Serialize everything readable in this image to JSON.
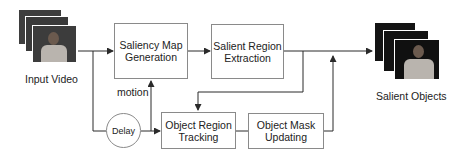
{
  "diagram": {
    "input": {
      "label": "Input Video"
    },
    "output": {
      "label": "Salient Objects"
    },
    "boxes": [
      {
        "id": "saliency",
        "label_line1": "Saliency Map",
        "label_line2": "Generation"
      },
      {
        "id": "extraction",
        "label_line1": "Salient Region",
        "label_line2": "Extraction"
      },
      {
        "id": "tracking",
        "label_line1": "Object Region",
        "label_line2": "Tracking"
      },
      {
        "id": "mask",
        "label_line1": "Object Mask",
        "label_line2": "Updating"
      }
    ],
    "delay": {
      "label": "Delay"
    },
    "motion_label": "motion",
    "colors": {
      "line": "#2a2a2a",
      "box_border": "#8a8a8a",
      "frame_dark": "#1a1a1a",
      "frame_input": "#3a3a3a"
    }
  }
}
